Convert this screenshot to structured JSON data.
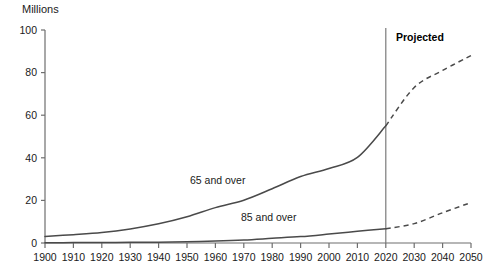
{
  "chart_data": {
    "type": "line",
    "title": "",
    "ylabel": "Millions",
    "xlabel": "",
    "ylim": [
      0,
      100
    ],
    "xlim": [
      1900,
      2050
    ],
    "yticks": [
      0,
      20,
      40,
      60,
      80,
      100
    ],
    "xticks": [
      1900,
      1910,
      1920,
      1930,
      1940,
      1950,
      1960,
      1970,
      1980,
      1990,
      2000,
      2010,
      2020,
      2030,
      2040,
      2050
    ],
    "grid": false,
    "legend_position": "inline-annotations",
    "annotations": [
      {
        "name": "projected-label",
        "text": "Projected",
        "x": 2025,
        "y": 95,
        "bold": true
      },
      {
        "name": "series-label-65",
        "text": "65 and over",
        "x": 1953,
        "y": 26
      },
      {
        "name": "series-label-85",
        "text": "85 and over",
        "x": 1977,
        "y": 9
      }
    ],
    "projection_divider_x": 2020,
    "line_color": "#4a4a4a",
    "series": [
      {
        "name": "65 and over",
        "x": [
          1900,
          1910,
          1920,
          1930,
          1940,
          1950,
          1960,
          1970,
          1980,
          1990,
          2000,
          2010,
          2020,
          2030,
          2040,
          2050
        ],
        "values": [
          3.1,
          3.9,
          4.9,
          6.6,
          9.0,
          12.3,
          16.6,
          20.1,
          25.5,
          31.2,
          35.0,
          40.2,
          55.0,
          73.0,
          81.0,
          88.0
        ],
        "solid_through": 2020,
        "dashed_from": 2020
      },
      {
        "name": "85 and over",
        "x": [
          1900,
          1910,
          1920,
          1930,
          1940,
          1950,
          1960,
          1970,
          1980,
          1990,
          2000,
          2010,
          2020,
          2030,
          2040,
          2050
        ],
        "values": [
          0.1,
          0.2,
          0.2,
          0.3,
          0.4,
          0.6,
          0.9,
          1.4,
          2.2,
          3.0,
          4.2,
          5.5,
          6.7,
          9.1,
          14.2,
          19.0
        ],
        "solid_through": 2020,
        "dashed_from": 2020
      }
    ]
  },
  "axis": {
    "unit_label": "Millions"
  }
}
